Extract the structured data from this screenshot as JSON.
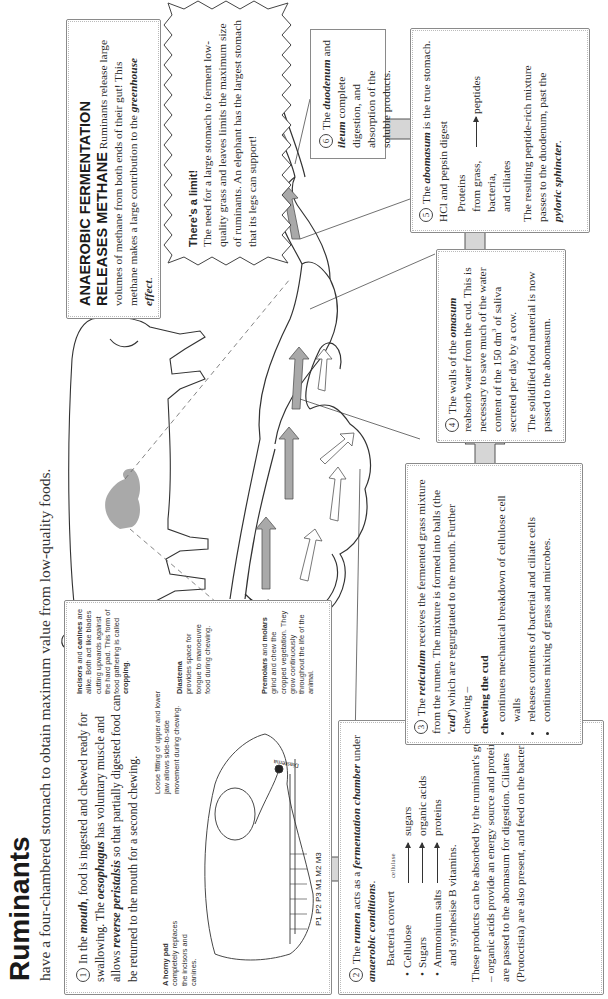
{
  "header": {
    "title": "Ruminants",
    "subtitle": "have a four-chambered stomach to obtain maximum value from low-quality foods."
  },
  "step1": {
    "number": "1",
    "text_a": "In the ",
    "mouth": "mouth",
    "text_b": ", food is ingested and chewed ready for swallowing. The ",
    "oesophagus": "oesophagus",
    "text_c": " has voluntary muscle and allows ",
    "reverse_peristalsis": "reverse peristalsis",
    "text_d": " so that partially digested food can be returned to the mouth for a second chewing.",
    "labels": {
      "horny_pad_title": "A horny pad",
      "horny_pad_text": "completely replaces the incisors and canines.",
      "loose_fitting": "Loose fitting of upper and lower jaw allows side-to-side movement during chewing.",
      "incisors_title": "Incisors",
      "incisors_and": " and ",
      "canines_title": "canines",
      "incisors_text": "are alike. Both act like blades cutting upwards against the hard pad. This form of food gathering is called ",
      "cropping": "cropping",
      "diastema_title": "Diastema",
      "diastema_text": "provides space for tongue to manoeuvre food during chewing.",
      "premolars_title": "Premolars",
      "premolars_and": " and ",
      "molars_title": "molars",
      "premolars_text": "grind and chew the cropped vegetation. They grow continuously throughout the life of the animal.",
      "teeth_codes": "P1 P2 P3 M1 M2 M3",
      "skull_diastema": "Diastema"
    }
  },
  "step2": {
    "number": "2",
    "text_a": "The ",
    "rumen": "rumen",
    "text_b": " acts as a ",
    "fermentation_chamber": "fermentation chamber",
    "text_c": " under ",
    "anaerobic": "anaerobic conditions",
    "text_d": ".",
    "bacteria_convert": "Bacteria convert",
    "reactions": [
      {
        "from": "Cellulose",
        "enzyme": "cellulase",
        "to": "sugars"
      },
      {
        "from": "Sugars",
        "enzyme": "",
        "to": "organic acids"
      },
      {
        "from": "Ammonium salts",
        "enzyme": "",
        "to": "proteins"
      }
    ],
    "vitamins": "and synthesise B vitamins.",
    "paragraph": "These products can be absorbed by the ruminant's gut – organic acids provide an energy source and proteins are passed to the abomasum for digestion. Ciliates (Protoctista) are also present, and feed on the bacteria."
  },
  "step3": {
    "number": "3",
    "text_a": "The ",
    "reticulum": "reticulum",
    "text_b": " receives the fermented grass mixture from the rumen. The mixture is formed into balls (the '",
    "cud": "cud",
    "text_c": "') which are regurgitated to the mouth. Further chewing –",
    "chewing_heading": "chewing the cud",
    "bullets": [
      "continues mechanical breakdown of cellulose cell walls",
      "releases contents of bacterial and ciliate cells",
      "continues mixing of grass and microbes."
    ]
  },
  "step4": {
    "number": "4",
    "text_a": "The walls of the ",
    "omasum": "omasum",
    "text_b": " reabsorb water from the cud. This is necessary to save much of the water content of the 150 dm",
    "sup": "3",
    "text_c": " of saliva secreted per day by a cow.",
    "text_d": "The solidified food material is now passed to the abomasum."
  },
  "step5": {
    "number": "5",
    "text_a": "The ",
    "abomasum": "abomasum",
    "text_b": " is the true stomach.",
    "hcl": "HCl and pepsin digest",
    "proteins_lines": [
      "Proteins",
      "from grass,",
      "bacteria,",
      "and ciliates"
    ],
    "product": "peptides",
    "text_c": "The resulting peptide-rich mixture passes to the duodenum, past the ",
    "pyloric": "pyloric sphincter",
    "text_d": "."
  },
  "step6": {
    "number": "6",
    "text_a": "The ",
    "duodenum": "duodenum",
    "text_b": " and ",
    "ileum": "ileum",
    "text_c": " complete digestion, and absorption of the soluble products."
  },
  "methane": {
    "heading": "ANAEROBIC FERMENTATION RELEASES METHANE",
    "text_a": " Ruminants release large volumes of methane from both ends of their gut! This methane makes a large contribution to the ",
    "greenhouse": "greenhouse effect",
    "text_b": "."
  },
  "limit": {
    "heading": "There's a limit!",
    "text": "The need for a large stomach to ferment low-quality grass and leaves limits the maximum size of ruminants. An elephant has the largest stomach that its legs can support!"
  },
  "colors": {
    "arrow_fill": "#d6d6d6",
    "arrow_stroke": "#555555",
    "stomach_highlight": "#a9a9a9",
    "box_border": "#8a8a8a"
  }
}
